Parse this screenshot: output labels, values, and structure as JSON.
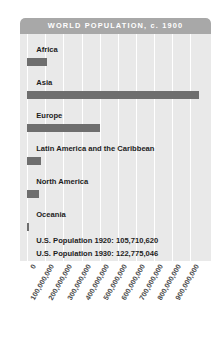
{
  "header": {
    "title": "WORLD POPULATION, c. 1900"
  },
  "colors": {
    "header_band": "#a8a8a8",
    "panel_background": "#e9e9e9",
    "bar": "#6e6e6e",
    "gridline": "#ffffff",
    "title_text": "#ffffff",
    "label_text": "#1d1d1d",
    "tick_text": "#4a4a4a"
  },
  "notes": [
    "U.S. Population 1920: 105,710,620",
    "U.S. Population 1930: 122,775,046"
  ],
  "chart_data": {
    "type": "bar",
    "orientation": "horizontal",
    "title": "WORLD POPULATION, c. 1900",
    "xlabel": "",
    "ylabel": "",
    "xlim": [
      0,
      1000000000
    ],
    "grid": true,
    "legend": null,
    "categories": [
      "Africa",
      "Asia",
      "Europe",
      "Latin America and the Caribbean",
      "North America",
      "Oceania"
    ],
    "values": [
      110000000,
      950000000,
      400000000,
      75000000,
      65000000,
      6000000
    ],
    "tick_labels": [
      "0",
      "100,000,000",
      "200,000,000",
      "300,000,000",
      "400,000,000",
      "500,000,000",
      "600,000,000",
      "700,000,000",
      "800,000,000",
      "900,000,000"
    ],
    "tick_values": [
      0,
      100000000,
      200000000,
      300000000,
      400000000,
      500000000,
      600000000,
      700000000,
      800000000,
      900000000
    ],
    "annotations": [
      "U.S. Population 1920: 105,710,620",
      "U.S. Population 1930: 122,775,046"
    ]
  }
}
